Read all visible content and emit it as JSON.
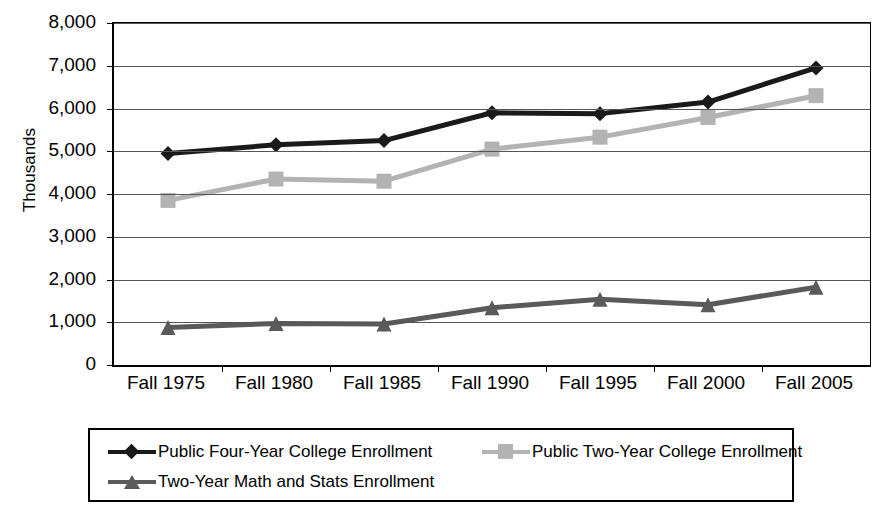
{
  "chart_data": {
    "type": "line",
    "title": "",
    "xlabel": "",
    "ylabel": "Thousands",
    "ylim": [
      0,
      8000
    ],
    "ytick_values": [
      8000,
      7000,
      6000,
      5000,
      4000,
      3000,
      2000,
      1000,
      0
    ],
    "ytick_labels": [
      "8,000",
      "7,000",
      "6,000",
      "5,000",
      "4,000",
      "3,000",
      "2,000",
      "1,000",
      "0"
    ],
    "categories": [
      "Fall 1975",
      "Fall 1980",
      "Fall 1985",
      "Fall 1990",
      "Fall 1995",
      "Fall 2000",
      "Fall 2005"
    ],
    "grid": true,
    "legend_position": "bottom",
    "series": [
      {
        "name": "Public Four-Year College Enrollment",
        "marker": "diamond",
        "color": "#1a1a1a",
        "values": [
          4950,
          5150,
          5250,
          5900,
          5880,
          6150,
          6950
        ]
      },
      {
        "name": "Public Two-Year College Enrollment",
        "marker": "square",
        "color": "#b3b3b3",
        "values": [
          3850,
          4350,
          4300,
          5050,
          5330,
          5790,
          6300
        ]
      },
      {
        "name": "Two-Year Math and Stats Enrollment",
        "marker": "triangle",
        "color": "#5a5a5a",
        "values": [
          880,
          970,
          960,
          1340,
          1540,
          1410,
          1820
        ]
      }
    ]
  },
  "axis": {
    "y_title": "Thousands"
  },
  "colors": {
    "background": "#ffffff",
    "axis": "#000000",
    "grid": "#555555",
    "series_four_year": "#1a1a1a",
    "series_two_year": "#b3b3b3",
    "series_math_stats": "#5a5a5a"
  }
}
